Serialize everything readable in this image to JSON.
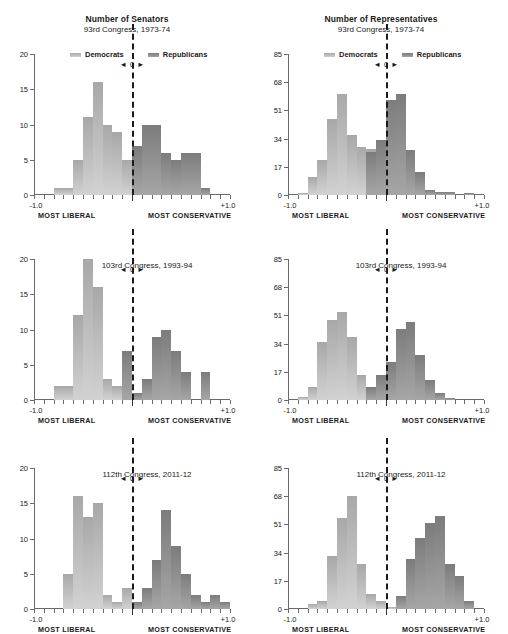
{
  "figure": {
    "columns": [
      {
        "title": "Number of Senators",
        "y_ticks": [
          "0",
          "5",
          "10",
          "15",
          "20"
        ],
        "ymax": 20
      },
      {
        "title": "Number of Representatives",
        "y_ticks": [
          "0",
          "17",
          "34",
          "51",
          "68",
          "85"
        ],
        "ymax": 85
      }
    ],
    "legend": {
      "dem_label": "Democrats",
      "rep_label": "Republicans"
    },
    "x_axis": {
      "left_tick_label": "-1.0",
      "right_tick_label": "+1.0",
      "center_label": "0",
      "left_arrow": "◄",
      "right_arrow": "►",
      "most_liberal": "MOST LIBERAL",
      "most_conservative": "MOST CONSERVATIVE",
      "min": -1.0,
      "max": 1.0
    },
    "colors": {
      "democrat": "#c6c6c6",
      "republican": "#8e8e8e",
      "axis": "#6a6a6a",
      "zero_line": "#1b1b1b"
    },
    "rows": [
      {
        "subtitle": "93rd Congress, 1973-74",
        "subtitle_position": "above"
      },
      {
        "subtitle": "103rd Congress, 1993-94",
        "subtitle_position": "inside"
      },
      {
        "subtitle": "112th Congress, 2011-12",
        "subtitle_position": "inside"
      }
    ]
  },
  "chart_data": [
    {
      "type": "bar",
      "title": "Number of Senators",
      "subtitle": "93rd Congress, 1973-74",
      "xlabel": "DW-NOMINATE ideology score (MOST LIBERAL to MOST CONSERVATIVE)",
      "ylabel": "Number of Senators",
      "xlim": [
        -1.0,
        1.0
      ],
      "ylim": [
        0,
        20
      ],
      "bin_width": 0.1,
      "grid": false,
      "legend": [
        "Democrats",
        "Republicans"
      ],
      "bin_starts": [
        -1.0,
        -0.9,
        -0.8,
        -0.7,
        -0.6,
        -0.5,
        -0.4,
        -0.3,
        -0.2,
        -0.1,
        0.0,
        0.1,
        0.2,
        0.3,
        0.4,
        0.5,
        0.6,
        0.7,
        0.8,
        0.9
      ],
      "series": [
        {
          "name": "Democrats",
          "values": [
            0,
            0,
            1,
            1,
            5,
            11,
            16,
            10,
            9,
            5,
            4,
            3,
            0,
            0,
            0,
            0,
            0,
            0,
            0,
            0
          ]
        },
        {
          "name": "Republicans",
          "values": [
            0,
            0,
            0,
            0,
            0,
            0,
            0,
            0,
            0,
            0,
            7,
            10,
            10,
            6,
            5,
            6,
            6,
            1,
            0,
            0
          ]
        }
      ]
    },
    {
      "type": "bar",
      "title": "Number of Representatives",
      "subtitle": "93rd Congress, 1973-74",
      "xlabel": "DW-NOMINATE ideology score (MOST LIBERAL to MOST CONSERVATIVE)",
      "ylabel": "Number of Representatives",
      "xlim": [
        -1.0,
        1.0
      ],
      "ylim": [
        0,
        85
      ],
      "bin_width": 0.1,
      "grid": false,
      "legend": [
        "Democrats",
        "Republicans"
      ],
      "bin_starts": [
        -1.0,
        -0.9,
        -0.8,
        -0.7,
        -0.6,
        -0.5,
        -0.4,
        -0.3,
        -0.2,
        -0.1,
        0.0,
        0.1,
        0.2,
        0.3,
        0.4,
        0.5,
        0.6,
        0.7,
        0.8,
        0.9
      ],
      "series": [
        {
          "name": "Democrats",
          "values": [
            0,
            1,
            11,
            21,
            46,
            61,
            36,
            29,
            28,
            33,
            0,
            0,
            0,
            0,
            0,
            0,
            0,
            0,
            0,
            0
          ]
        },
        {
          "name": "Republicans",
          "values": [
            0,
            0,
            0,
            0,
            0,
            0,
            0,
            0,
            26,
            33,
            57,
            61,
            27,
            14,
            3,
            2,
            2,
            0,
            1,
            0
          ]
        }
      ]
    },
    {
      "type": "bar",
      "title": "Number of Senators",
      "subtitle": "103rd Congress, 1993-94",
      "xlabel": "DW-NOMINATE ideology score (MOST LIBERAL to MOST CONSERVATIVE)",
      "ylabel": "Number of Senators",
      "xlim": [
        -1.0,
        1.0
      ],
      "ylim": [
        0,
        20
      ],
      "bin_width": 0.1,
      "grid": false,
      "legend": [
        "Democrats",
        "Republicans"
      ],
      "bin_starts": [
        -1.0,
        -0.9,
        -0.8,
        -0.7,
        -0.6,
        -0.5,
        -0.4,
        -0.3,
        -0.2,
        -0.1,
        0.0,
        0.1,
        0.2,
        0.3,
        0.4,
        0.5,
        0.6,
        0.7,
        0.8,
        0.9
      ],
      "series": [
        {
          "name": "Democrats",
          "values": [
            0,
            0,
            2,
            2,
            12,
            20,
            16,
            3,
            2,
            0,
            0,
            0,
            0,
            0,
            0,
            0,
            0,
            0,
            0,
            0
          ]
        },
        {
          "name": "Republicans",
          "values": [
            0,
            0,
            0,
            0,
            0,
            0,
            0,
            0,
            0,
            7,
            1,
            3,
            9,
            10,
            7,
            4,
            0,
            4,
            0,
            0
          ]
        }
      ]
    },
    {
      "type": "bar",
      "title": "Number of Representatives",
      "subtitle": "103rd Congress, 1993-94",
      "xlabel": "DW-NOMINATE ideology score (MOST LIBERAL to MOST CONSERVATIVE)",
      "ylabel": "Number of Representatives",
      "xlim": [
        -1.0,
        1.0
      ],
      "ylim": [
        0,
        85
      ],
      "bin_width": 0.1,
      "grid": false,
      "legend": [
        "Democrats",
        "Republicans"
      ],
      "bin_starts": [
        -1.0,
        -0.9,
        -0.8,
        -0.7,
        -0.6,
        -0.5,
        -0.4,
        -0.3,
        -0.2,
        -0.1,
        0.0,
        0.1,
        0.2,
        0.3,
        0.4,
        0.5,
        0.6,
        0.7,
        0.8,
        0.9
      ],
      "series": [
        {
          "name": "Democrats",
          "values": [
            0,
            2,
            8,
            35,
            48,
            53,
            38,
            15,
            0,
            0,
            0,
            0,
            0,
            0,
            0,
            0,
            0,
            0,
            0,
            0
          ]
        },
        {
          "name": "Republicans",
          "values": [
            0,
            0,
            0,
            0,
            0,
            0,
            0,
            0,
            8,
            15,
            23,
            43,
            47,
            27,
            12,
            4,
            1,
            0,
            0,
            0
          ]
        }
      ]
    },
    {
      "type": "bar",
      "title": "Number of Senators",
      "subtitle": "112th Congress, 2011-12",
      "xlabel": "DW-NOMINATE ideology score (MOST LIBERAL to MOST CONSERVATIVE)",
      "ylabel": "Number of Senators",
      "xlim": [
        -1.0,
        1.0
      ],
      "ylim": [
        0,
        20
      ],
      "bin_width": 0.1,
      "grid": false,
      "legend": [
        "Democrats",
        "Republicans"
      ],
      "bin_starts": [
        -1.0,
        -0.9,
        -0.8,
        -0.7,
        -0.6,
        -0.5,
        -0.4,
        -0.3,
        -0.2,
        -0.1,
        0.0,
        0.1,
        0.2,
        0.3,
        0.4,
        0.5,
        0.6,
        0.7,
        0.8,
        0.9
      ],
      "series": [
        {
          "name": "Democrats",
          "values": [
            0,
            0,
            0,
            5,
            16,
            13,
            15,
            2,
            1,
            3,
            0,
            0,
            0,
            0,
            0,
            0,
            0,
            0,
            0,
            0
          ]
        },
        {
          "name": "Republicans",
          "values": [
            0,
            0,
            0,
            0,
            0,
            0,
            0,
            0,
            0,
            0,
            1,
            3,
            7,
            14,
            9,
            5,
            2,
            1,
            2,
            1
          ]
        }
      ]
    },
    {
      "type": "bar",
      "title": "Number of Representatives",
      "subtitle": "112th Congress, 2011-12",
      "xlabel": "DW-NOMINATE ideology score (MOST LIBERAL to MOST CONSERVATIVE)",
      "ylabel": "Number of Representatives",
      "xlim": [
        -1.0,
        1.0
      ],
      "ylim": [
        0,
        85
      ],
      "bin_width": 0.1,
      "grid": false,
      "legend": [
        "Democrats",
        "Republicans"
      ],
      "bin_starts": [
        -1.0,
        -0.9,
        -0.8,
        -0.7,
        -0.6,
        -0.5,
        -0.4,
        -0.3,
        -0.2,
        -0.1,
        0.0,
        0.1,
        0.2,
        0.3,
        0.4,
        0.5,
        0.6,
        0.7,
        0.8,
        0.9
      ],
      "series": [
        {
          "name": "Democrats",
          "values": [
            0,
            0,
            3,
            5,
            32,
            55,
            68,
            27,
            9,
            5,
            1,
            0,
            0,
            0,
            0,
            0,
            0,
            0,
            0,
            0
          ]
        },
        {
          "name": "Republicans",
          "values": [
            0,
            0,
            0,
            0,
            0,
            0,
            0,
            0,
            0,
            0,
            0,
            8,
            30,
            43,
            52,
            56,
            27,
            20,
            5,
            0
          ]
        }
      ]
    }
  ]
}
